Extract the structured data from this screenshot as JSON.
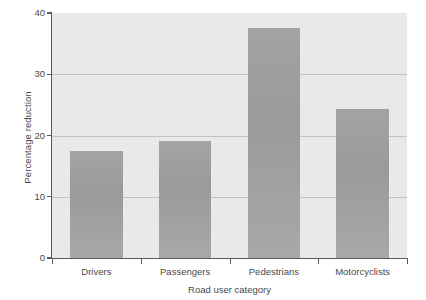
{
  "chart_data": {
    "type": "bar",
    "title": "",
    "subtitle": "",
    "xlabel": "Road user category",
    "ylabel": "Percentage reduction",
    "categories": [
      "Drivers",
      "Passengers",
      "Pedestrians",
      "Motorcyclists"
    ],
    "values": [
      17.4,
      19.1,
      37.6,
      24.3
    ],
    "ylim": [
      0,
      40
    ],
    "yticks": [
      0,
      10,
      20,
      30,
      40
    ],
    "ytick_labels": [
      "0",
      "10",
      "20",
      "30",
      "40"
    ],
    "grid": true,
    "gridlines_at": [
      10,
      20,
      30
    ],
    "legend": null,
    "legend_position": "none",
    "annotations": [],
    "colors": {
      "bar_fill": "#9e9e9e",
      "plot_background": "#e9e9e9",
      "page_background": "#ffffff",
      "axis_line": "#5a5a5a",
      "gridline": "#c3c3c3",
      "text": "#4a4a4a"
    }
  }
}
